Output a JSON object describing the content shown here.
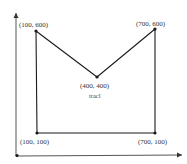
{
  "diagram": {
    "colors": {
      "line": "#1a1a1a",
      "axis": "#333333",
      "text": "#333333"
    },
    "axes": {
      "origin_marker": true,
      "x_arrow": true,
      "y_arrow": true
    },
    "shape_label": "tracl",
    "points": [
      {
        "label": "(100, 600)"
      },
      {
        "label": "(400, 400)"
      },
      {
        "label": "(700, 600)"
      },
      {
        "label": "(700, 100)"
      },
      {
        "label": "(100, 100)"
      }
    ]
  }
}
